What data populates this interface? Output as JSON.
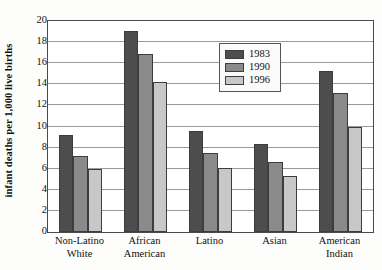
{
  "chart_data": {
    "type": "bar",
    "title": "",
    "xlabel": "",
    "ylabel": "infant deaths per 1,000 live births",
    "ylim": [
      0,
      20
    ],
    "ytick_step": 2,
    "yticks": [
      0,
      2,
      4,
      6,
      8,
      10,
      12,
      14,
      16,
      18,
      20
    ],
    "grid": true,
    "legend_position": "top-center-right",
    "categories": [
      "Non-Latino White",
      "African American",
      "Latino",
      "Asian",
      "American Indian"
    ],
    "category_lines": [
      [
        "Non-Latino",
        "White"
      ],
      [
        "African",
        "American"
      ],
      [
        "Latino",
        ""
      ],
      [
        "Asian",
        ""
      ],
      [
        "American",
        "Indian"
      ]
    ],
    "series": [
      {
        "name": "1983",
        "color": "#4d4d4d",
        "values": [
          9.2,
          19.1,
          9.6,
          8.3,
          15.3
        ]
      },
      {
        "name": "1990",
        "color": "#8a8a8a",
        "values": [
          7.2,
          16.9,
          7.5,
          6.6,
          13.2
        ]
      },
      {
        "name": "1996",
        "color": "#c8c8c8",
        "values": [
          6.0,
          14.2,
          6.1,
          5.3,
          10.0
        ]
      }
    ]
  }
}
